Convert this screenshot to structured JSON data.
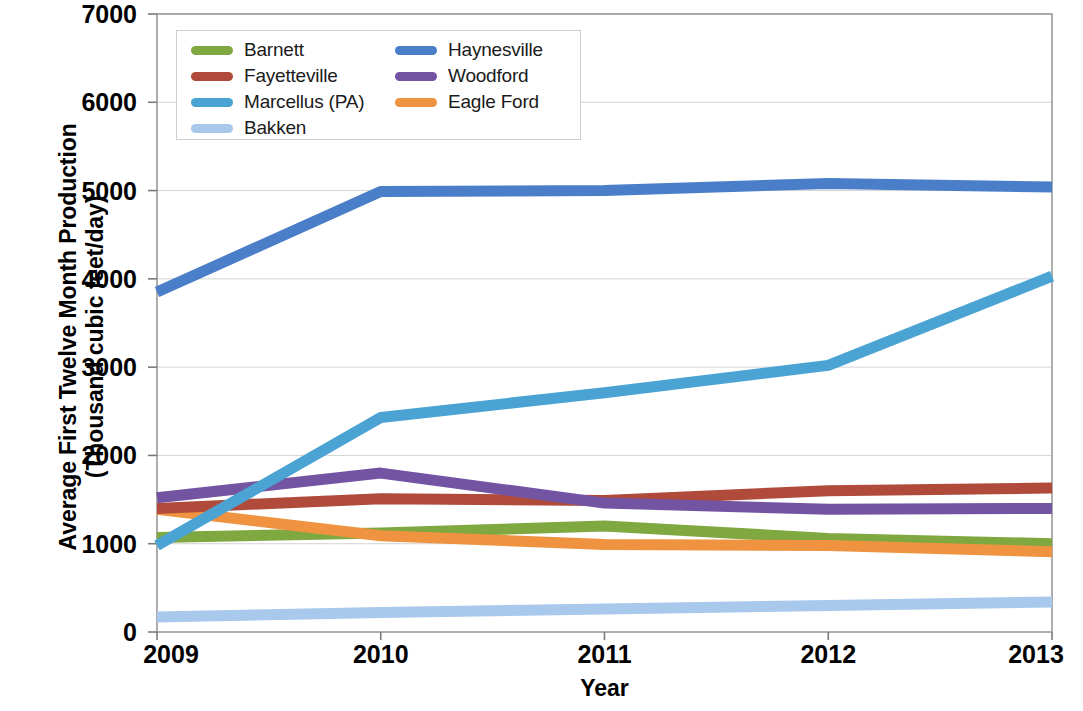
{
  "chart_data": {
    "type": "line",
    "title": "",
    "xlabel": "Year",
    "ylabel": "Average First Twelve Month Production (Thousand cubic feet/day)",
    "ylabel_line1": "Average First Twelve Month Production",
    "ylabel_line2": "(Thousand cubic feet/day)",
    "x": [
      2009,
      2010,
      2011,
      2012,
      2013
    ],
    "xtick_labels": [
      "2009",
      "2010",
      "2011",
      "2012",
      "2013"
    ],
    "ytick_labels": [
      "0",
      "1000",
      "2000",
      "3000",
      "4000",
      "5000",
      "6000",
      "7000"
    ],
    "ytick_values": [
      0,
      1000,
      2000,
      3000,
      4000,
      5000,
      6000,
      7000
    ],
    "xlim": [
      2009,
      2013
    ],
    "ylim": [
      0,
      7000
    ],
    "grid": "horizontal",
    "legend_position": "upper-left-inside",
    "series": [
      {
        "name": "Barnett",
        "color": "#7fa840",
        "values": [
          1070,
          1120,
          1200,
          1060,
          1000
        ]
      },
      {
        "name": "Fayetteville",
        "color": "#b04b3c",
        "values": [
          1400,
          1510,
          1490,
          1600,
          1630
        ]
      },
      {
        "name": "Marcellus (PA)",
        "color": "#4ba3d3",
        "values": [
          980,
          2430,
          2710,
          3020,
          4030
        ]
      },
      {
        "name": "Bakken",
        "color": "#a8c8ec",
        "values": [
          170,
          220,
          260,
          300,
          340
        ]
      },
      {
        "name": "Haynesville",
        "color": "#4a7ec9",
        "values": [
          3850,
          4990,
          5000,
          5080,
          5040
        ]
      },
      {
        "name": "Woodford",
        "color": "#7254a3",
        "values": [
          1520,
          1800,
          1460,
          1390,
          1400
        ]
      },
      {
        "name": "Eagle Ford",
        "color": "#ef9340",
        "values": [
          1390,
          1090,
          990,
          980,
          910
        ]
      }
    ],
    "legend_order": [
      "Barnett",
      "Haynesville",
      "Fayetteville",
      "Woodford",
      "Marcellus (PA)",
      "Eagle Ford",
      "Bakken"
    ]
  },
  "plot_geometry": {
    "left": 157,
    "right": 1052,
    "top": 14,
    "bottom": 632
  }
}
